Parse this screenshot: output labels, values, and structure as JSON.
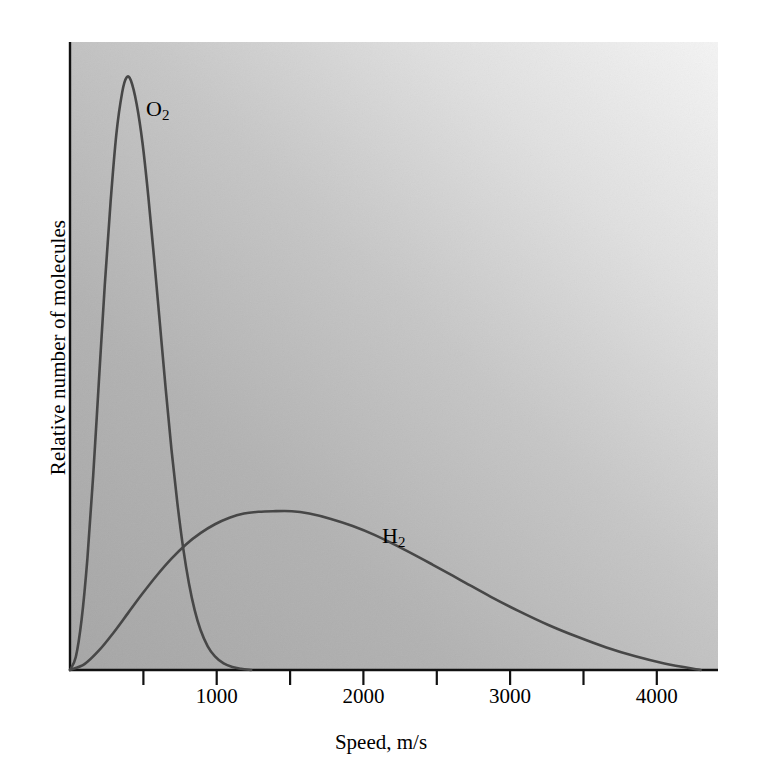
{
  "chart_data": {
    "type": "line",
    "title": "",
    "subtitle": "",
    "xlabel": "Speed, m/s",
    "ylabel": "Relative number of molecules",
    "xlim": [
      0,
      4470
    ],
    "ylim": [
      0,
      1.06
    ],
    "grid": false,
    "legend_position": "inline-annotation",
    "xticks": [
      0,
      500,
      1000,
      1500,
      2000,
      2500,
      3000,
      3500,
      4000
    ],
    "xtick_labels": [
      "",
      "",
      "1000",
      "",
      "2000",
      "",
      "3000",
      "",
      "4000"
    ],
    "yticks": [],
    "ytick_labels": [],
    "annotations": [
      {
        "text": "O2",
        "display": "O",
        "subscript": "2",
        "x": 580,
        "y": 0.82
      },
      {
        "text": "H2",
        "display": "H",
        "subscript": "2",
        "x": 2200,
        "y": 0.185
      }
    ],
    "series": [
      {
        "name": "O2",
        "label": "O₂",
        "color": "#474747",
        "peak_x": 390,
        "peak_y": 1.0,
        "x": [
          0,
          40,
          80,
          120,
          160,
          200,
          240,
          280,
          320,
          360,
          390,
          420,
          460,
          500,
          540,
          580,
          620,
          660,
          700,
          740,
          780,
          820,
          860,
          900,
          950,
          1000,
          1060,
          1120,
          1180,
          1250
        ],
        "y": [
          0.0,
          0.022,
          0.085,
          0.188,
          0.328,
          0.49,
          0.65,
          0.79,
          0.905,
          0.975,
          1.0,
          0.995,
          0.955,
          0.89,
          0.8,
          0.695,
          0.585,
          0.475,
          0.372,
          0.283,
          0.207,
          0.147,
          0.101,
          0.068,
          0.04,
          0.023,
          0.011,
          0.005,
          0.002,
          0.0
        ]
      },
      {
        "name": "H2",
        "label": "H₂",
        "color": "#474747",
        "peak_x": 1530,
        "peak_y": 0.268,
        "x": [
          0,
          100,
          200,
          300,
          400,
          500,
          600,
          700,
          800,
          900,
          1000,
          1100,
          1200,
          1300,
          1400,
          1530,
          1650,
          1800,
          1950,
          2100,
          2300,
          2500,
          2700,
          2900,
          3100,
          3300,
          3500,
          3700,
          3900,
          4100,
          4350
        ],
        "y": [
          0.0,
          0.01,
          0.033,
          0.063,
          0.096,
          0.129,
          0.16,
          0.188,
          0.212,
          0.231,
          0.246,
          0.257,
          0.264,
          0.267,
          0.268,
          0.268,
          0.264,
          0.255,
          0.243,
          0.228,
          0.204,
          0.178,
          0.151,
          0.124,
          0.099,
          0.076,
          0.056,
          0.038,
          0.023,
          0.011,
          0.0
        ]
      }
    ],
    "background": {
      "plot_fill_light": "#f2f2f2",
      "plot_fill_dark": "#a8a8a8",
      "axis_color": "#000000",
      "page_background": "#ffffff"
    }
  },
  "axes": {
    "x_title": "Speed, m/s",
    "y_title": "Relative number of molecules",
    "tick_labels": [
      "1000",
      "2000",
      "3000",
      "4000"
    ]
  },
  "labels": {
    "o2_element": "O",
    "o2_sub": "2",
    "h2_element": "H",
    "h2_sub": "2"
  }
}
